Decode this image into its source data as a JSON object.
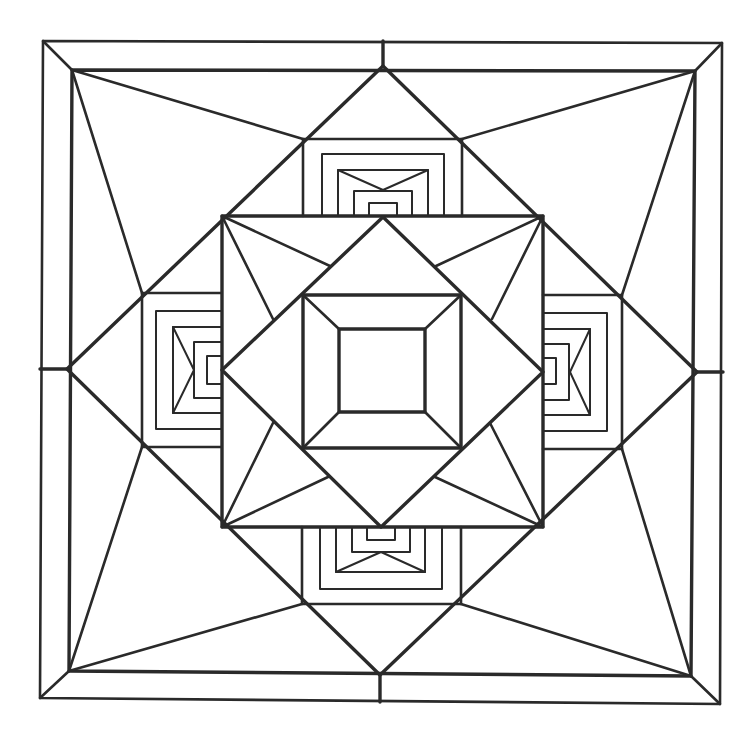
{
  "drawing": {
    "title": "",
    "background": "#ffffff",
    "stroke_color": "#2a2a2a",
    "outer_frame": {
      "outer": [
        [
          43,
          41
        ],
        [
          722,
          43
        ],
        [
          720,
          704
        ],
        [
          40,
          698
        ]
      ],
      "inner": [
        [
          72,
          70
        ],
        [
          695,
          71
        ],
        [
          691,
          676
        ],
        [
          69,
          671
        ]
      ],
      "mid_ticks": [
        [
          [
            383,
            41
          ],
          [
            383,
            66
          ]
        ],
        [
          [
            723,
            372
          ],
          [
            697,
            372
          ]
        ],
        [
          [
            380,
            702
          ],
          [
            380,
            675
          ]
        ],
        [
          [
            40,
            369
          ],
          [
            67,
            369
          ]
        ]
      ]
    },
    "big_diamond": [
      [
        383,
        66
      ],
      [
        697,
        372
      ],
      [
        380,
        675
      ],
      [
        67,
        369
      ]
    ],
    "corner_spikes": [
      [
        [
          72,
          70
        ],
        [
          303,
          139
        ]
      ],
      [
        [
          72,
          70
        ],
        [
          142,
          293
        ]
      ],
      [
        [
          695,
          71
        ],
        [
          462,
          139
        ]
      ],
      [
        [
          695,
          71
        ],
        [
          622,
          295
        ]
      ],
      [
        [
          691,
          676
        ],
        [
          461,
          604
        ]
      ],
      [
        [
          691,
          676
        ],
        [
          622,
          449
        ]
      ],
      [
        [
          69,
          671
        ],
        [
          302,
          604
        ]
      ],
      [
        [
          69,
          671
        ],
        [
          142,
          447
        ]
      ]
    ],
    "middle_square": [
      [
        222,
        216
      ],
      [
        543,
        216
      ],
      [
        543,
        527
      ],
      [
        222,
        527
      ]
    ],
    "middle_spikes": [
      [
        [
          222,
          216
        ],
        [
          330,
          266
        ]
      ],
      [
        [
          222,
          216
        ],
        [
          273,
          319
        ]
      ],
      [
        [
          543,
          216
        ],
        [
          436,
          266
        ]
      ],
      [
        [
          543,
          216
        ],
        [
          492,
          319
        ]
      ],
      [
        [
          543,
          527
        ],
        [
          490,
          423
        ]
      ],
      [
        [
          543,
          527
        ],
        [
          435,
          477
        ]
      ],
      [
        [
          222,
          527
        ],
        [
          273,
          423
        ]
      ],
      [
        [
          222,
          527
        ],
        [
          328,
          477
        ]
      ]
    ],
    "inner_diamond": [
      [
        383,
        217
      ],
      [
        543,
        372
      ],
      [
        381,
        527
      ],
      [
        222,
        370
      ]
    ],
    "framed_square": {
      "outer": [
        [
          303,
          295
        ],
        [
          461,
          295
        ],
        [
          461,
          448
        ],
        [
          303,
          448
        ]
      ],
      "inner": [
        [
          339,
          329
        ],
        [
          425,
          329
        ],
        [
          425,
          412
        ],
        [
          339,
          412
        ]
      ]
    },
    "side_panels": {
      "top": {
        "base": 216,
        "boxes": [
          [
            303,
            462,
            139
          ],
          [
            322,
            444,
            154
          ],
          [
            338,
            428,
            170
          ],
          [
            354,
            412,
            191
          ],
          [
            369,
            397,
            203
          ]
        ],
        "apex": [
          383,
          190
        ]
      },
      "bottom": {
        "base": 527,
        "boxes": [
          [
            302,
            461,
            604
          ],
          [
            320,
            442,
            589
          ],
          [
            336,
            425,
            572
          ],
          [
            352,
            410,
            552
          ],
          [
            367,
            395,
            540
          ]
        ],
        "apex": [
          381,
          552
        ]
      },
      "left": {
        "base": 221,
        "boxes": [
          [
            293,
            447,
            142
          ],
          [
            311,
            429,
            156
          ],
          [
            327,
            413,
            173
          ],
          [
            342,
            398,
            194
          ],
          [
            356,
            384,
            207
          ]
        ],
        "apex": [
          194,
          370
        ]
      },
      "right": {
        "base": 543,
        "boxes": [
          [
            295,
            449,
            622
          ],
          [
            313,
            431,
            607
          ],
          [
            329,
            415,
            590
          ],
          [
            344,
            400,
            569
          ],
          [
            358,
            384,
            556
          ]
        ],
        "apex": [
          570,
          372
        ]
      }
    }
  }
}
